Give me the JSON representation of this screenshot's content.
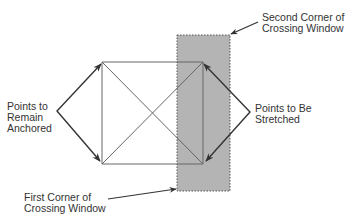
{
  "diagram": {
    "type": "stretch-crossing-window",
    "colors": {
      "background": "#ffffff",
      "window_fill": "#b4b4b4",
      "window_border": "#555555",
      "object_lines": "#666666",
      "arrows": "#333333",
      "text": "#333333"
    },
    "labels": {
      "second_corner": [
        "Second Corner of",
        "Crossing Window"
      ],
      "points_stretched": [
        "Points to Be",
        "Stretched"
      ],
      "points_anchored": [
        "Points to",
        "Remain",
        "Anchored"
      ],
      "first_corner": [
        "First Corner of",
        "Crossing Window"
      ]
    },
    "geometry": {
      "rectangle": {
        "x1": 102,
        "y1": 62,
        "x2": 203,
        "y2": 164
      },
      "crossing_window": {
        "x1": 177,
        "y1": 35,
        "x2": 230,
        "y2": 191
      }
    }
  }
}
